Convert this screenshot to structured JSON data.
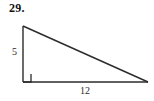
{
  "figure": {
    "problem_number": "29.",
    "shape_name": "right-triangle",
    "background_color": "#ffffff",
    "stroke_color": "#2b2b2b",
    "labels": {
      "vertical_leg": "5",
      "horizontal_leg": "12"
    },
    "right_angle_marker": {
      "present": true,
      "size": 8
    },
    "geometry": {
      "apex": {
        "x": 23,
        "y": 26
      },
      "right_angle_vertex": {
        "x": 23,
        "y": 82
      },
      "far_vertex": {
        "x": 148,
        "y": 82
      }
    }
  }
}
